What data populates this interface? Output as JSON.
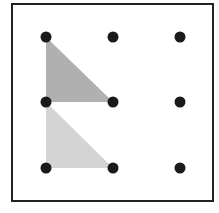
{
  "diagram": {
    "type": "dot-grid",
    "grid": {
      "rows": 3,
      "cols": 3
    },
    "frame": {
      "x": 12,
      "y": 4,
      "width": 201,
      "height": 197,
      "stroke": "#222222"
    },
    "dot_color": "#1a1a1a",
    "dots": [
      {
        "x": 46,
        "y": 37
      },
      {
        "x": 113,
        "y": 37
      },
      {
        "x": 180,
        "y": 37
      },
      {
        "x": 46,
        "y": 102
      },
      {
        "x": 113,
        "y": 102
      },
      {
        "x": 180,
        "y": 102
      },
      {
        "x": 46,
        "y": 168
      },
      {
        "x": 113,
        "y": 168
      },
      {
        "x": 180,
        "y": 168
      }
    ],
    "shapes": [
      {
        "name": "upper-triangle",
        "points": "46,37 46,102 113,102",
        "fill": "#b0b0b0"
      },
      {
        "name": "lower-triangle",
        "points": "46,102 46,168 113,168",
        "fill": "#d4d4d4"
      }
    ]
  }
}
